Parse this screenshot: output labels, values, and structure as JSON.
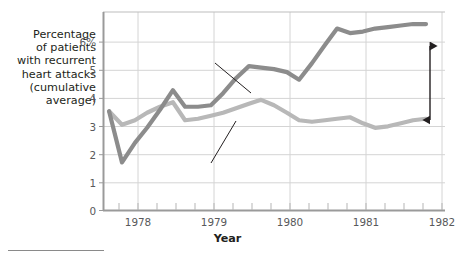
{
  "chart_data": {
    "type": "line",
    "title": "",
    "xlabel": "Year",
    "ylabel": "Percentage of patients with recurrent heart attacks (cumulative average)",
    "ylabel_lines": [
      "Percentage",
      "of patients",
      "with recurrent",
      "heart attacks",
      "(cumulative",
      "average)"
    ],
    "ylim": [
      0,
      6.6
    ],
    "xlim": [
      1977.75,
      1982.25
    ],
    "yticks": [
      0,
      1,
      2,
      3,
      4,
      5,
      6
    ],
    "ytick_labels": [
      "0",
      "1",
      "2",
      "3",
      "4",
      "5",
      "6%"
    ],
    "xticks": [
      1978,
      1979,
      1980,
      1981,
      1982
    ],
    "xtick_labels": [
      "1978",
      "1979",
      "1980",
      "1981",
      "1982"
    ],
    "x_minor_step": 0.25,
    "grid": "horizontal-and-year-verticals",
    "legend": "inline-callouts",
    "x": [
      1977.83,
      1978.0,
      1978.17,
      1978.33,
      1978.5,
      1978.67,
      1978.83,
      1979.0,
      1979.17,
      1979.33,
      1979.5,
      1979.67,
      1979.83,
      1980.0,
      1980.17,
      1980.33,
      1980.5,
      1980.67,
      1980.83,
      1981.0,
      1981.17,
      1981.33,
      1981.5,
      1981.67,
      1981.83,
      1982.0
    ],
    "series": [
      {
        "name": "Control patients",
        "color": "#8c8c8c",
        "values": [
          3.3,
          1.6,
          2.25,
          2.75,
          3.35,
          4.0,
          3.45,
          3.45,
          3.5,
          3.9,
          4.4,
          4.8,
          4.75,
          4.7,
          4.6,
          4.35,
          4.9,
          5.5,
          6.05,
          5.9,
          5.95,
          6.05,
          6.1,
          6.15,
          6.2,
          6.2
        ]
      },
      {
        "name": "Lifestyle modification patients",
        "color": "#b8b8b8",
        "values": [
          3.3,
          2.85,
          3.0,
          3.25,
          3.45,
          3.6,
          3.0,
          3.05,
          3.15,
          3.25,
          3.4,
          3.55,
          3.68,
          3.5,
          3.25,
          3.0,
          2.95,
          3.0,
          3.05,
          3.1,
          2.9,
          2.75,
          2.8,
          2.9,
          3.0,
          3.05
        ]
      }
    ],
    "annotations": [
      {
        "name": "control-patients-callout",
        "text": "Control patients",
        "leader_from": [
          215,
          62
        ],
        "leader_to": [
          252,
          92
        ]
      },
      {
        "name": "lifestyle-modification-callout",
        "text": "Lifestyle modification patients",
        "leader_from": [
          212,
          164
        ],
        "leader_to": [
          236,
          121
        ]
      },
      {
        "name": "effect-annotation",
        "text_lines": [
          "Modifying lifestyle",
          "reduced recurrent",
          "heart attacks"
        ],
        "arrow_x": 430,
        "arrow_y_top": 46,
        "arrow_y_bottom": 120,
        "arrow_style": "double-headed-vertical"
      }
    ],
    "colors": {
      "control_line": "#8c8c8c",
      "lifestyle_line": "#b8b8b8",
      "grid": "#d4d4d4",
      "axis": "#9a9a9a",
      "text": "#231f20",
      "tick_text": "#58595b"
    }
  }
}
